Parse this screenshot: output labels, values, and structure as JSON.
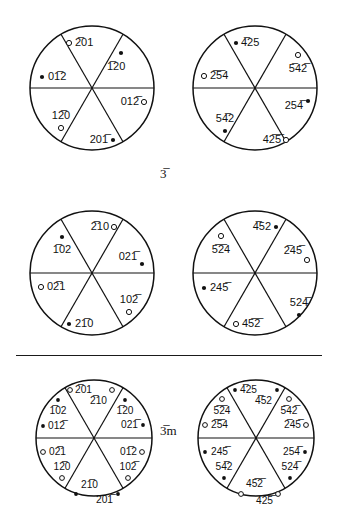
{
  "figure": {
    "marker_legend": {
      "filled": "pole in upper hemisphere",
      "open": "pole in lower hemisphere"
    },
    "colors": {
      "ink": "#111111",
      "paper": "#ffffff"
    },
    "group_labels": {
      "row1": "3̅",
      "row3": "3̅m"
    },
    "rows": [
      {
        "name": "row-1",
        "group": "3̅",
        "circles": [
          {
            "name": "circle-r1c1",
            "poles": [
              {
                "index": "2̅01",
                "marker": "open",
                "label_side": "right"
              },
              {
                "index": "1̅20",
                "marker": "filled",
                "label_side": "below"
              },
              {
                "index": "012̅",
                "marker": "open",
                "label_side": "left"
              },
              {
                "index": "201̅",
                "marker": "filled",
                "label_side": "left"
              },
              {
                "index": "12̅0",
                "marker": "open",
                "label_side": "above"
              },
              {
                "index": "01̅2",
                "marker": "filled",
                "label_side": "right"
              }
            ]
          },
          {
            "name": "circle-r1c2",
            "poles": [
              {
                "index": "4̅25",
                "marker": "filled",
                "label_side": "right"
              },
              {
                "index": "5̅42̅",
                "marker": "open",
                "label_side": "below"
              },
              {
                "index": "254̅",
                "marker": "filled",
                "label_side": "left"
              },
              {
                "index": "42̅5̅",
                "marker": "open",
                "label_side": "left"
              },
              {
                "index": "54̅2",
                "marker": "filled",
                "label_side": "above"
              },
              {
                "index": "2̅5̅4",
                "marker": "open",
                "label_side": "right"
              }
            ]
          }
        ]
      },
      {
        "name": "row-2",
        "group": "",
        "circles": [
          {
            "name": "circle-r2c1",
            "poles": [
              {
                "index": "2̅10",
                "marker": "open",
                "label_side": "left"
              },
              {
                "index": "021̅",
                "marker": "filled",
                "label_side": "left"
              },
              {
                "index": "102̅",
                "marker": "open",
                "label_side": "above"
              },
              {
                "index": "21̅0",
                "marker": "filled",
                "label_side": "right"
              },
              {
                "index": "02̅1",
                "marker": "open",
                "label_side": "right"
              },
              {
                "index": "1̅02",
                "marker": "filled",
                "label_side": "below"
              }
            ]
          },
          {
            "name": "circle-r2c2",
            "poles": [
              {
                "index": "4̅52",
                "marker": "filled",
                "label_side": "left"
              },
              {
                "index": "2̅45̅",
                "marker": "open",
                "label_side": "above"
              },
              {
                "index": "524̅",
                "marker": "filled",
                "label_side": "above"
              },
              {
                "index": "45̅2̅",
                "marker": "open",
                "label_side": "right"
              },
              {
                "index": "245̅",
                "marker": "filled",
                "label_side": "right"
              },
              {
                "index": "5̅2̅4",
                "marker": "open",
                "label_side": "below"
              }
            ]
          }
        ]
      },
      {
        "name": "row-3",
        "group": "3̅m",
        "circles": [
          {
            "name": "circle-r3c1",
            "poles": [
              {
                "index": "2̅01",
                "marker": "open",
                "label_side": "right"
              },
              {
                "index": "2̅10",
                "marker": "open",
                "label_side": "left"
              },
              {
                "index": "1̅20",
                "marker": "filled",
                "label_side": "below"
              },
              {
                "index": "021̅",
                "marker": "filled",
                "label_side": "left"
              },
              {
                "index": "012̅",
                "marker": "open",
                "label_side": "left"
              },
              {
                "index": "102̅",
                "marker": "open",
                "label_side": "above"
              },
              {
                "index": "201̅",
                "marker": "filled",
                "label_side": "left"
              },
              {
                "index": "21̅0",
                "marker": "filled",
                "label_side": "right"
              },
              {
                "index": "12̅0",
                "marker": "open",
                "label_side": "above"
              },
              {
                "index": "02̅1",
                "marker": "open",
                "label_side": "right"
              },
              {
                "index": "01̅2",
                "marker": "filled",
                "label_side": "right"
              },
              {
                "index": "1̅02",
                "marker": "filled",
                "label_side": "below"
              }
            ]
          },
          {
            "name": "circle-r3c2",
            "poles": [
              {
                "index": "4̅25",
                "marker": "filled",
                "label_side": "right"
              },
              {
                "index": "4̅52",
                "marker": "filled",
                "label_side": "left"
              },
              {
                "index": "5̅42̅",
                "marker": "open",
                "label_side": "below"
              },
              {
                "index": "2̅45̅",
                "marker": "open",
                "label_side": "above"
              },
              {
                "index": "254̅",
                "marker": "filled",
                "label_side": "left"
              },
              {
                "index": "524̅",
                "marker": "filled",
                "label_side": "above"
              },
              {
                "index": "42̅5̅",
                "marker": "open",
                "label_side": "left"
              },
              {
                "index": "45̅2̅",
                "marker": "open",
                "label_side": "right"
              },
              {
                "index": "54̅2",
                "marker": "filled",
                "label_side": "above"
              },
              {
                "index": "245̅",
                "marker": "filled",
                "label_side": "right"
              },
              {
                "index": "2̅5̅4",
                "marker": "open",
                "label_side": "right"
              },
              {
                "index": "5̅2̅4",
                "marker": "open",
                "label_side": "below"
              }
            ]
          }
        ]
      }
    ],
    "labels": {
      "r1c1": {
        "t_2bar01": "2̅01",
        "t_1bar20": "1̅20",
        "t_012bar": "012̅",
        "t_201bar": "201̅",
        "t_12bar0": "12̅0",
        "t_01bar2": "01̅2"
      },
      "r1c2": {
        "t_4bar25": "4̅25",
        "t_5bar42bar": "5̅42̅",
        "t_254bar": "254̅",
        "t_42bar5bar": "42̅5̅",
        "t_54bar2": "54̅2",
        "t_2bar5bar4": "2̅5̅4"
      },
      "r2c1": {
        "t_2bar10": "2̅10",
        "t_021bar": "021̅",
        "t_102bar": "102̅",
        "t_21bar0": "21̅0",
        "t_02bar1": "02̅1",
        "t_1bar02": "1̅02"
      },
      "r2c2": {
        "t_4bar52": "4̅52",
        "t_2bar45bar": "2̅45̅",
        "t_524bar": "524̅",
        "t_45bar2bar": "45̅2̅",
        "t_245bar": "245̅",
        "t_5bar2bar4": "5̅2̅4"
      },
      "r3c1": {
        "t_2bar01": "2̅01",
        "t_2bar10": "2̅10",
        "t_1bar20": "1̅20",
        "t_021bar": "021̅",
        "t_012bar": "012̅",
        "t_102bar": "102̅",
        "t_201bar": "201̅",
        "t_21bar0": "21̅0",
        "t_12bar0": "12̅0",
        "t_02bar1": "02̅1",
        "t_01bar2": "01̅2",
        "t_1bar02": "1̅02"
      },
      "r3c2": {
        "t_4bar25": "4̅25",
        "t_4bar52": "4̅52",
        "t_5bar42bar": "5̅42̅",
        "t_2bar45bar": "2̅45̅",
        "t_254bar": "254̅",
        "t_524bar": "524̅",
        "t_42bar5bar": "42̅5̅",
        "t_45bar2bar": "45̅2̅",
        "t_54bar2": "54̅2",
        "t_245bar": "245̅",
        "t_2bar5bar4": "2̅5̅4",
        "t_5bar2bar4": "5̅2̅4"
      }
    }
  }
}
